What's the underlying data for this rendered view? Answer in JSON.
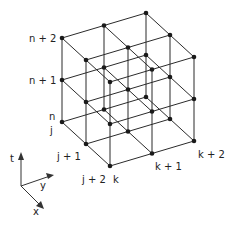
{
  "diagram": {
    "type": "3d-lattice-grid",
    "grid": {
      "size": [
        3,
        3,
        3
      ],
      "origin_px": [
        62,
        122
      ],
      "step_j_px": [
        24,
        22
      ],
      "step_k_px": [
        42,
        -12.5
      ],
      "step_n_px": [
        0,
        -42
      ],
      "color": "#2b2b2b"
    },
    "labels": {
      "n": "n",
      "n1": "n + 1",
      "n2": "n + 2",
      "j": "j",
      "j1": "j + 1",
      "j2": "j + 2",
      "k": "k",
      "k1": "k + 1",
      "k2": "k + 2"
    },
    "axes": {
      "t": "t",
      "y": "y",
      "x": "x"
    }
  }
}
